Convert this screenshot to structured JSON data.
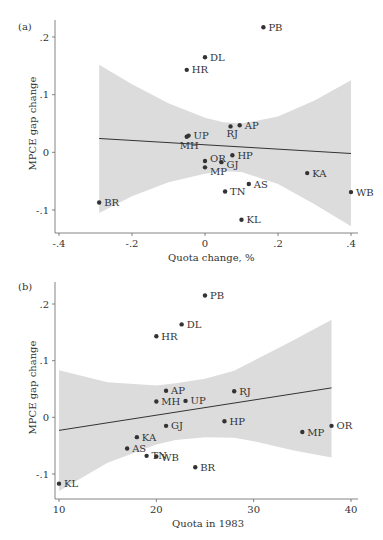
{
  "chart_data": [
    {
      "type": "scatter",
      "panel_label": "(a)",
      "title": "",
      "xlabel": "Quota change, %",
      "ylabel": "MPCE gap change",
      "xlim": [
        -0.4,
        0.4
      ],
      "ylim": [
        -0.13,
        0.22
      ],
      "xticks": [
        -0.4,
        -0.2,
        0,
        0.2,
        0.4
      ],
      "xtick_labels": [
        "-.4",
        "-.2",
        "0",
        ".2",
        ".4"
      ],
      "yticks": [
        -0.1,
        0,
        0.1,
        0.2
      ],
      "ytick_labels": [
        "-.1",
        "0",
        ".1",
        ".2"
      ],
      "grid": false,
      "legend": null,
      "points": [
        {
          "label": "PB",
          "x": 0.16,
          "y": 0.217
        },
        {
          "label": "DL",
          "x": 0.0,
          "y": 0.165
        },
        {
          "label": "HR",
          "x": -0.05,
          "y": 0.143
        },
        {
          "label": "RJ",
          "x": 0.07,
          "y": 0.045
        },
        {
          "label": "AP",
          "x": 0.095,
          "y": 0.047
        },
        {
          "label": "UP",
          "x": -0.045,
          "y": 0.029
        },
        {
          "label": "MH",
          "x": -0.05,
          "y": 0.027
        },
        {
          "label": "HP",
          "x": 0.075,
          "y": -0.005
        },
        {
          "label": "OR",
          "x": 0.0,
          "y": -0.015
        },
        {
          "label": "GJ",
          "x": 0.045,
          "y": -0.017
        },
        {
          "label": "MP",
          "x": 0.0,
          "y": -0.026
        },
        {
          "label": "AS",
          "x": 0.12,
          "y": -0.055
        },
        {
          "label": "TN",
          "x": 0.055,
          "y": -0.068
        },
        {
          "label": "KA",
          "x": 0.28,
          "y": -0.036
        },
        {
          "label": "WB",
          "x": 0.4,
          "y": -0.069
        },
        {
          "label": "KL",
          "x": 0.1,
          "y": -0.117
        },
        {
          "label": "BR",
          "x": -0.29,
          "y": -0.087
        }
      ],
      "fit_line": {
        "x": [
          -0.29,
          0.4
        ],
        "y": [
          0.024,
          -0.002
        ]
      },
      "confidence_band": {
        "x": [
          -0.29,
          -0.2,
          -0.1,
          0.0,
          0.05,
          0.1,
          0.2,
          0.3,
          0.4
        ],
        "upper": [
          0.152,
          0.118,
          0.085,
          0.06,
          0.052,
          0.05,
          0.062,
          0.09,
          0.125
        ],
        "lower": [
          -0.105,
          -0.076,
          -0.052,
          -0.037,
          -0.033,
          -0.034,
          -0.055,
          -0.09,
          -0.128
        ]
      }
    },
    {
      "type": "scatter",
      "panel_label": "(b)",
      "title": "",
      "xlabel": "Quota in 1983",
      "ylabel": "MPCE gap change",
      "xlim": [
        9.5,
        40.5
      ],
      "ylim": [
        -0.14,
        0.23
      ],
      "xticks": [
        10,
        20,
        30,
        40
      ],
      "xtick_labels": [
        "10",
        "20",
        "30",
        "40"
      ],
      "yticks": [
        -0.1,
        0,
        0.1,
        0.2
      ],
      "ytick_labels": [
        "-.1",
        "0",
        ".1",
        ".2"
      ],
      "grid": false,
      "legend": null,
      "points": [
        {
          "label": "PB",
          "x": 25.0,
          "y": 0.215
        },
        {
          "label": "DL",
          "x": 22.6,
          "y": 0.164
        },
        {
          "label": "HR",
          "x": 20.0,
          "y": 0.143
        },
        {
          "label": "AP",
          "x": 21.0,
          "y": 0.047
        },
        {
          "label": "MH",
          "x": 20.0,
          "y": 0.028
        },
        {
          "label": "UP",
          "x": 23.0,
          "y": 0.029
        },
        {
          "label": "RJ",
          "x": 28.0,
          "y": 0.046
        },
        {
          "label": "GJ",
          "x": 21.0,
          "y": -0.015
        },
        {
          "label": "HP",
          "x": 27.0,
          "y": -0.007
        },
        {
          "label": "KA",
          "x": 18.0,
          "y": -0.035
        },
        {
          "label": "AS",
          "x": 17.0,
          "y": -0.055
        },
        {
          "label": "TN",
          "x": 19.0,
          "y": -0.068
        },
        {
          "label": "WB",
          "x": 20.0,
          "y": -0.069
        },
        {
          "label": "BR",
          "x": 24.0,
          "y": -0.088
        },
        {
          "label": "KL",
          "x": 10.0,
          "y": -0.117
        },
        {
          "label": "MP",
          "x": 35.0,
          "y": -0.026
        },
        {
          "label": "OR",
          "x": 38.0,
          "y": -0.015
        }
      ],
      "fit_line": {
        "x": [
          10,
          38
        ],
        "y": [
          -0.023,
          0.052
        ]
      },
      "confidence_band": {
        "x": [
          10,
          15,
          20,
          22,
          25,
          28,
          30,
          34,
          38
        ],
        "upper": [
          0.083,
          0.062,
          0.056,
          0.06,
          0.068,
          0.082,
          0.1,
          0.135,
          0.172
        ],
        "lower": [
          -0.13,
          -0.08,
          -0.048,
          -0.04,
          -0.035,
          -0.036,
          -0.042,
          -0.058,
          -0.071
        ]
      }
    }
  ]
}
